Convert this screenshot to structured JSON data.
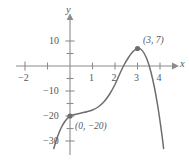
{
  "chart_data": {
    "type": "line",
    "title": "",
    "xlabel": "x",
    "ylabel": "y",
    "xlim": [
      -2.7,
      4.7
    ],
    "ylim": [
      -33,
      13
    ],
    "grid": false,
    "legend": null,
    "x_ticks": [
      {
        "value": -2,
        "label": "−2"
      },
      {
        "value": -1,
        "label": ""
      },
      {
        "value": 1,
        "label": "1"
      },
      {
        "value": 2,
        "label": "2"
      },
      {
        "value": 3,
        "label": "3"
      },
      {
        "value": 4,
        "label": "4"
      }
    ],
    "y_ticks": [
      {
        "value": 10,
        "label": "10"
      },
      {
        "value": 5,
        "label": ""
      },
      {
        "value": -5,
        "label": ""
      },
      {
        "value": -10,
        "label": "−10"
      },
      {
        "value": -15,
        "label": ""
      },
      {
        "value": -20,
        "label": "−20"
      },
      {
        "value": -25,
        "label": ""
      },
      {
        "value": -30,
        "label": "−30"
      }
    ],
    "series": [
      {
        "name": "curve",
        "color": "#6e6e70",
        "points": [
          [
            -0.72,
            -33.0
          ],
          [
            -0.62,
            -30.0
          ],
          [
            -0.5,
            -27.0
          ],
          [
            -0.38,
            -24.5
          ],
          [
            -0.26,
            -22.6
          ],
          [
            -0.14,
            -21.2
          ],
          [
            0.0,
            -20.0
          ],
          [
            0.25,
            -19.3
          ],
          [
            0.5,
            -18.8
          ],
          [
            0.75,
            -18.3
          ],
          [
            1.0,
            -17.6
          ],
          [
            1.25,
            -16.4
          ],
          [
            1.5,
            -14.4
          ],
          [
            1.75,
            -11.4
          ],
          [
            2.0,
            -7.4
          ],
          [
            2.2,
            -3.4
          ],
          [
            2.4,
            0.4
          ],
          [
            2.6,
            3.4
          ],
          [
            2.8,
            5.8
          ],
          [
            3.0,
            7.0
          ],
          [
            3.15,
            6.7
          ],
          [
            3.3,
            5.0
          ],
          [
            3.45,
            2.0
          ],
          [
            3.6,
            -2.5
          ],
          [
            3.75,
            -8.5
          ],
          [
            3.9,
            -16.0
          ],
          [
            4.0,
            -22.0
          ],
          [
            4.1,
            -28.5
          ],
          [
            4.16,
            -33.0
          ]
        ]
      }
    ],
    "annotated_points": [
      {
        "x": 3,
        "y": 7,
        "label": "(3, 7)",
        "marker": "dot",
        "color": "#6e6e70"
      },
      {
        "x": 0,
        "y": -20,
        "label": "(0, −20)",
        "marker": "dot",
        "color": "#6e6e70"
      }
    ],
    "colors": {
      "axis": "#8c8c8e",
      "curve": "#6e6e70",
      "text": "#58585a",
      "background": "#ffffff"
    }
  },
  "labels": {
    "y_axis_name": "y",
    "x_axis_name": "x",
    "x_neg2": "−2",
    "x_1": "1",
    "x_2": "2",
    "x_3": "3",
    "x_4": "4",
    "y_10": "10",
    "y_neg10": "−10",
    "y_neg20": "−20",
    "y_neg30": "−30",
    "point_peak": "(3, 7)",
    "point_intercept": "(0, −20)"
  }
}
